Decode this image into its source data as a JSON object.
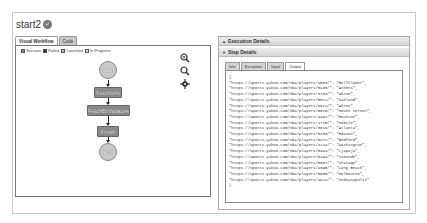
{
  "header": {
    "title": "start2",
    "status_icon": "check-circle-icon"
  },
  "left_panel": {
    "tabs": [
      {
        "label": "Visual Workflow",
        "active": true
      },
      {
        "label": "Code",
        "active": false
      }
    ],
    "legend": [
      {
        "label": "Success",
        "color": "#888888"
      },
      {
        "label": "Failed",
        "color": "#222222"
      },
      {
        "label": "Canceled",
        "color": "#bbbbbb"
      },
      {
        "label": "In Progress",
        "color": "#dddddd"
      }
    ],
    "tools": [
      "zoom-in-icon",
      "zoom-out-icon",
      "recenter-icon"
    ],
    "nodes": [
      {
        "label": "Start",
        "type": "circle"
      },
      {
        "label": "FetchUrls",
        "type": "rect"
      },
      {
        "label": "FetchBirthplaces",
        "type": "rect"
      },
      {
        "label": "Finish",
        "type": "rect"
      },
      {
        "label": "End",
        "type": "circle"
      }
    ]
  },
  "right_panel": {
    "execution_details_label": "Execution Details",
    "step_details_label": "Step Details",
    "inner_tabs": [
      {
        "label": "Info",
        "active": false
      },
      {
        "label": "Exception",
        "active": false
      },
      {
        "label": "Input",
        "active": false
      },
      {
        "label": "Output",
        "active": true
      }
    ],
    "output_lines": [
      "{",
      "\"https://sports.yahoo.com/nba/players/4563/\": \"Bellflower\",",
      "\"https://sports.yahoo.com/nba/players/5185/\": \"Athens\",",
      "\"https://sports.yahoo.com/nba/players/3704/\": \"Akron\",",
      "\"https://sports.yahoo.com/nba/players/5012/\": \"Oakland\",",
      "\"https://sports.yahoo.com/nba/players/4612/\": \"Akron\",",
      "\"https://sports.yahoo.com/nba/players/5015/\": \"Mount Vernon\",",
      "\"https://sports.yahoo.com/nba/players/4497/\": \"Houston\",",
      "\"https://sports.yahoo.com/nba/players/4720/\": \"Mobile\",",
      "\"https://sports.yahoo.com/nba/players/3818/\": \"Atlanta\",",
      "\"https://sports.yahoo.com/nba/players/5433/\": \"Edison\",",
      "\"https://sports.yahoo.com/nba/players/5471/\": \"Bedford\",",
      "\"https://sports.yahoo.com/nba/players/4244/\": \"Washington\",",
      "\"https://sports.yahoo.com/nba/players/5464/\": \"Ljapaja\",",
      "\"https://sports.yahoo.com/nba/players/5294/\": \"Yaounde\",",
      "\"https://sports.yahoo.com/nba/players/5007/\": \"Chicago\",",
      "\"https://sports.yahoo.com/nba/players/4390/\": \"Long Beach\",",
      "\"https://sports.yahoo.com/nba/players/5800/\": \"Melbourne\",",
      "\"https://sports.yahoo.com/nba/players/4624/\": \"Indianapolis\"",
      "}"
    ]
  }
}
